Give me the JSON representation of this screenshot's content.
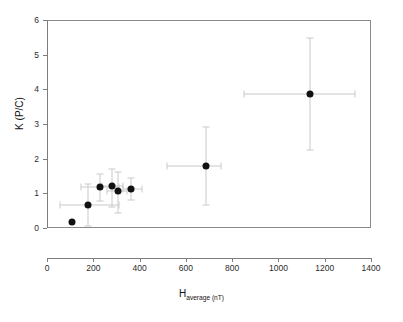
{
  "chart_data": {
    "type": "scatter",
    "title": "",
    "xlabel": "H",
    "xlabel_sub": "average (nT)",
    "ylabel": "K (P/C)",
    "xlim": [
      0,
      1400
    ],
    "ylim": [
      0,
      6
    ],
    "xticks": [
      0,
      200,
      400,
      600,
      800,
      1000,
      1200,
      1400
    ],
    "yticks": [
      0,
      1,
      2,
      3,
      4,
      5,
      6
    ],
    "grid": false,
    "legend": null,
    "marker_color": "#111111",
    "errorbar_color": "#c9c9c9",
    "points": [
      {
        "x": 110,
        "y": 0.18,
        "xerr_low": null,
        "xerr_high": null,
        "yerr_low": null,
        "yerr_high": null
      },
      {
        "x": 175,
        "y": 0.66,
        "xerr_low": 55,
        "xerr_high": 310,
        "yerr_low": 0.06,
        "yerr_high": 1.28
      },
      {
        "x": 228,
        "y": 1.17,
        "xerr_low": 148,
        "xerr_high": 310,
        "yerr_low": 0.78,
        "yerr_high": 1.55
      },
      {
        "x": 283,
        "y": 1.2,
        "xerr_low": 238,
        "xerr_high": 330,
        "yerr_low": 0.62,
        "yerr_high": 1.7
      },
      {
        "x": 307,
        "y": 1.08,
        "xerr_low": 258,
        "xerr_high": 345,
        "yerr_low": 0.42,
        "yerr_high": 1.62
      },
      {
        "x": 365,
        "y": 1.13,
        "xerr_low": 330,
        "xerr_high": 412,
        "yerr_low": 0.82,
        "yerr_high": 1.45
      },
      {
        "x": 687,
        "y": 1.79,
        "xerr_low": 518,
        "xerr_high": 752,
        "yerr_low": 0.67,
        "yerr_high": 2.9
      },
      {
        "x": 1135,
        "y": 3.87,
        "xerr_low": 850,
        "xerr_high": 1330,
        "yerr_low": 2.24,
        "yerr_high": 5.48
      }
    ]
  }
}
